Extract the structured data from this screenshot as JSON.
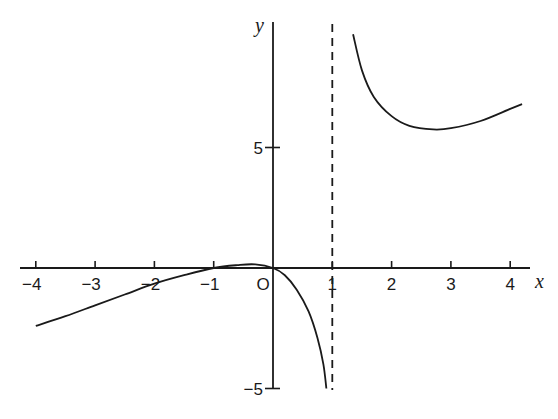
{
  "chart_data": {
    "type": "line",
    "title": "",
    "xlabel": "x",
    "ylabel": "y",
    "xlim": [
      -4.2,
      4.3
    ],
    "ylim": [
      -5,
      10
    ],
    "grid": false,
    "legend": null,
    "x_ticks": [
      -4,
      -3,
      -2,
      -1,
      0,
      1,
      2,
      3,
      4
    ],
    "x_tick_labels": [
      "−4",
      "−3",
      "−2",
      "−1",
      "O",
      "1",
      "2",
      "3",
      "4"
    ],
    "y_ticks": [
      5,
      -5
    ],
    "y_tick_labels": [
      "5",
      "−5"
    ],
    "asymptote": {
      "type": "vertical",
      "x": 1,
      "style": "dashed"
    },
    "series": [
      {
        "name": "left-branch",
        "points": [
          [
            -4.0,
            -2.4
          ],
          [
            -3.5,
            -2.0
          ],
          [
            -3.0,
            -1.55
          ],
          [
            -2.5,
            -1.1
          ],
          [
            -2.0,
            -0.65
          ],
          [
            -1.5,
            -0.3
          ],
          [
            -1.0,
            0.0
          ],
          [
            -0.6,
            0.12
          ],
          [
            -0.3,
            0.15
          ],
          [
            0.0,
            0.0
          ],
          [
            0.2,
            -0.3
          ],
          [
            0.4,
            -0.9
          ],
          [
            0.6,
            -1.8
          ],
          [
            0.75,
            -2.9
          ],
          [
            0.85,
            -4.0
          ],
          [
            0.9,
            -5.0
          ]
        ]
      },
      {
        "name": "right-branch",
        "points": [
          [
            1.35,
            9.7
          ],
          [
            1.5,
            8.2
          ],
          [
            1.7,
            7.1
          ],
          [
            2.0,
            6.3
          ],
          [
            2.3,
            5.9
          ],
          [
            2.7,
            5.75
          ],
          [
            3.0,
            5.8
          ],
          [
            3.5,
            6.1
          ],
          [
            4.0,
            6.6
          ],
          [
            4.2,
            6.8
          ]
        ]
      }
    ]
  }
}
